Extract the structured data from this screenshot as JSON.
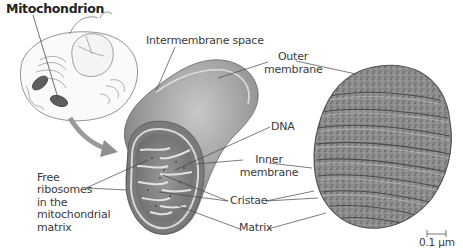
{
  "figure": {
    "title": "Mitochondrion",
    "labels": {
      "intermembrane_space": "Intermembrane space",
      "outer_membrane_line1": "Outer",
      "outer_membrane_line2": "membrane",
      "dna": "DNA",
      "inner_membrane_line1": "Inner",
      "inner_membrane_line2": "membrane",
      "cristae": "Cristae",
      "matrix": "Matrix",
      "free_ribosomes": [
        "Free",
        "ribosomes",
        "in the",
        "mitochondrial",
        "matrix"
      ]
    },
    "scale_bar": "0.1 µm",
    "panels": [
      "cell-overview-drawing",
      "mitochondrion-cutaway-drawing",
      "electron-micrograph"
    ]
  },
  "colors": {
    "background": "#ffffff",
    "text": "#3a3a3a",
    "leader_line": "#444444",
    "arrow": "#8f8f8f",
    "organelle_dark": "#6f6f6f",
    "organelle_mid": "#9a9a9a",
    "membrane_light": "#d6d6d6",
    "micrograph": "#8a8a8a"
  }
}
